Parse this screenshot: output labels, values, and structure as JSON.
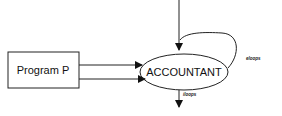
{
  "diagram": {
    "nodes": [
      {
        "id": "program",
        "label": "Program P",
        "shape": "rectangle"
      },
      {
        "id": "accountant",
        "label": "ACCOUNTANT",
        "shape": "ellipse"
      }
    ],
    "edges": [
      {
        "from": "external-top",
        "to": "accountant",
        "label": ""
      },
      {
        "from": "program",
        "to": "accountant",
        "label": ""
      },
      {
        "from": "program",
        "to": "accountant",
        "label": ""
      },
      {
        "from": "accountant",
        "to": "accountant",
        "label": "eloops"
      },
      {
        "from": "accountant",
        "to": "external-bottom",
        "label": "iloops"
      }
    ],
    "labels": {
      "program": "Program P",
      "accountant": "ACCOUNTANT",
      "self_loop": "eloops",
      "output": "iloops"
    },
    "colors": {
      "stroke": "#111111",
      "background": "#ffffff"
    }
  }
}
